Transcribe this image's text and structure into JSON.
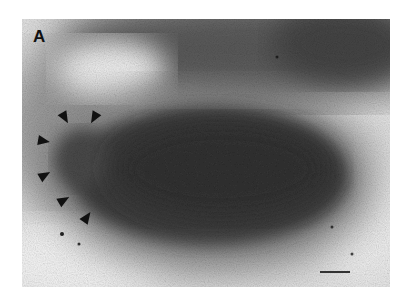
{
  "figure": {
    "panel_label": "A",
    "arrowheads": [
      {
        "x": 43,
        "y": 99,
        "rotation": 135
      },
      {
        "x": 72,
        "y": 99,
        "rotation": 45
      },
      {
        "x": 22,
        "y": 122,
        "rotation": 180
      },
      {
        "x": 23,
        "y": 156,
        "rotation": 225
      },
      {
        "x": 42,
        "y": 181,
        "rotation": 225
      },
      {
        "x": 65,
        "y": 198,
        "rotation": 240
      }
    ],
    "scale_bar": {
      "visible": true
    },
    "colors": {
      "dense_body": "#3a3a3a",
      "background_light": "#e8e8e8",
      "mid_gray": "#8a8a8a"
    }
  }
}
